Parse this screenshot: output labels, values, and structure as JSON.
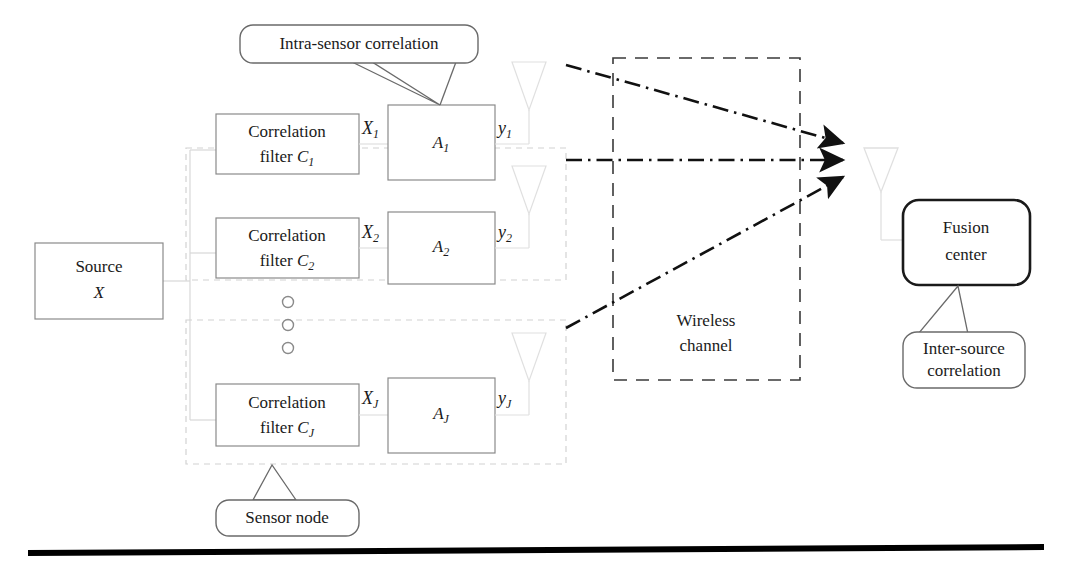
{
  "figure": {
    "type": "block-diagram"
  },
  "source": {
    "line1": "Source",
    "line2": "X"
  },
  "sensors": [
    {
      "filter_line1": "Correlation",
      "filter_line2_prefix": "filter ",
      "filter_symbol": "C",
      "filter_subscript": "1",
      "input_symbol": "X",
      "input_subscript": "1",
      "amp_symbol": "A",
      "amp_subscript": "1",
      "output_symbol": "y",
      "output_subscript": "1"
    },
    {
      "filter_line1": "Correlation",
      "filter_line2_prefix": "filter ",
      "filter_symbol": "C",
      "filter_subscript": "2",
      "input_symbol": "X",
      "input_subscript": "2",
      "amp_symbol": "A",
      "amp_subscript": "2",
      "output_symbol": "y",
      "output_subscript": "2"
    },
    {
      "filter_line1": "Correlation",
      "filter_line2_prefix": "filter ",
      "filter_symbol": "C",
      "filter_subscript": "J",
      "input_symbol": "X",
      "input_subscript": "J",
      "amp_symbol": "A",
      "amp_subscript": "J",
      "output_symbol": "y",
      "output_subscript": "J"
    }
  ],
  "ellipsis": {
    "marker": "circle",
    "count": 3
  },
  "channel": {
    "line1": "Wireless",
    "line2": "channel"
  },
  "fusion_center": {
    "line1": "Fusion",
    "line2": "center"
  },
  "callouts": {
    "intra_sensor": "Intra-sensor correlation",
    "sensor_node": "Sensor node",
    "inter_source_line1": "Inter-source",
    "inter_source_line2": "correlation"
  },
  "colors": {
    "ink": "#1a1a1a",
    "box_stroke": "#8a8a8a",
    "faint_stroke": "#d8d8d8",
    "dashed_group": "#cfcfcf",
    "channel_stroke": "#3a3a3a",
    "arrow": "#111111",
    "rule": "#000000"
  }
}
